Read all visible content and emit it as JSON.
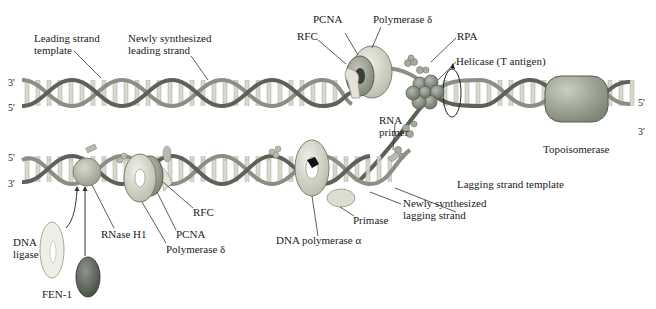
{
  "diagram": {
    "type": "DNA replication fork",
    "colors": {
      "strand_template": "#8a8f85",
      "strand_new": "#6b6f68",
      "rungs": "#cfcfc4",
      "pcna": "#9aa093",
      "polymerase_delta": "#d7d8cc",
      "rfc": "#e6e3d6",
      "helicase": "#8b9488",
      "rpa": "#a6ab9d",
      "topoisomerase": "#9aa195",
      "rnase_h1": "#b6bbae",
      "fen1": "#5f675f",
      "dna_ligase": "#efefe6",
      "primase": "#dcdccf",
      "polymerase_alpha": "#e7e8dc",
      "label_text": "#1a1a1a",
      "leader_line": "#333333"
    },
    "strand_ends": {
      "leading_top": "3'",
      "leading_bottom": "5'",
      "lagging_top": "5'",
      "lagging_bottom": "3'",
      "parental_top": "5'",
      "parental_bottom": "3'"
    },
    "labels": {
      "leading_strand_template": "Leading strand\ntemplate",
      "newly_synthesized_leading_strand": "Newly synthesized\nleading strand",
      "pcna_top": "PCNA",
      "rfc_top": "RFC",
      "polymerase_delta_top": "Polymerase δ",
      "rpa": "RPA",
      "helicase": "Helicase (T antigen)",
      "topoisomerase": "Topoisomerase",
      "rna_primer": "RNA\nprimer",
      "lagging_strand_template": "Lagging strand template",
      "newly_synthesized_lagging_strand": "Newly synthesized\nlagging strand",
      "primase": "Primase",
      "dna_polymerase_alpha": "DNA polymerase α",
      "rfc_bottom": "RFC",
      "pcna_bottom": "PCNA",
      "polymerase_delta_bottom": "Polymerase δ",
      "rnase_h1": "RNase H1",
      "dna_ligase": "DNA\nligase",
      "fen1": "FEN-1"
    }
  }
}
